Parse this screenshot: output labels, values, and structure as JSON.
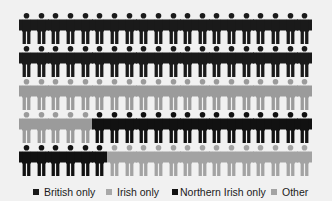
{
  "chart_data": {
    "type": "pictogram",
    "title": "",
    "unit": "person icon = 1%",
    "grid": {
      "rows": 5,
      "cols": 20,
      "total": 100
    },
    "categories": [
      "British only",
      "Irish only",
      "Northern Irish only",
      "Other"
    ],
    "values": [
      40,
      25,
      21,
      14
    ],
    "colors": [
      "#1a1a1a",
      "#9b9b9b",
      "#111111",
      "#a3a3a3"
    ],
    "legend_position": "bottom"
  },
  "legend": {
    "items": [
      {
        "label": "British only",
        "color": "#1a1a1a"
      },
      {
        "label": "Irish only",
        "color": "#a8a8a8"
      },
      {
        "label": "Northern Irish only",
        "color": "#111111"
      },
      {
        "label": "Other",
        "color": "#a3a3a3"
      }
    ]
  }
}
